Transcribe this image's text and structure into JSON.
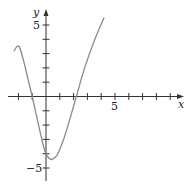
{
  "chart_data": {
    "type": "line",
    "title": "",
    "xlabel": "x",
    "ylabel": "y",
    "xlim": [
      -3,
      10
    ],
    "ylim": [
      -6,
      6
    ],
    "grid": false,
    "legend": null,
    "x_tick_step": 1,
    "y_tick_step": 1,
    "x_tick_labels": [
      {
        "value": 5,
        "label": "5"
      }
    ],
    "y_tick_labels": [
      {
        "value": 5,
        "label": "5"
      },
      {
        "value": -5,
        "label": "−5"
      }
    ],
    "series": [
      {
        "name": "f(x)",
        "color": "#8a8a8a",
        "points": [
          [
            -2.3,
            3.2
          ],
          [
            -2.1,
            3.5
          ],
          [
            -1.9,
            3.4
          ],
          [
            -1.6,
            2.4
          ],
          [
            -1.3,
            1.2
          ],
          [
            -1.0,
            0.0
          ],
          [
            -0.7,
            -1.3
          ],
          [
            -0.4,
            -2.6
          ],
          [
            -0.15,
            -3.6
          ],
          [
            0.0,
            -4.0
          ],
          [
            0.2,
            -4.3
          ],
          [
            0.45,
            -4.4
          ],
          [
            0.8,
            -4.1
          ],
          [
            1.2,
            -3.2
          ],
          [
            1.6,
            -2.0
          ],
          [
            2.2,
            0.0
          ],
          [
            2.8,
            2.0
          ],
          [
            3.5,
            3.9
          ],
          [
            4.2,
            5.5
          ]
        ]
      }
    ],
    "annotations": []
  },
  "axes": {
    "x_axis_label": "x",
    "y_axis_label": "y",
    "tick_label_5": "5",
    "tick_label_y5": "5",
    "tick_label_neg5": "−5"
  }
}
